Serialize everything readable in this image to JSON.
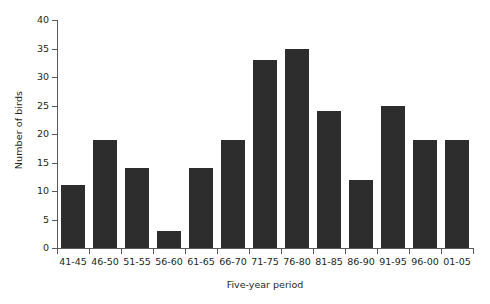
{
  "chart_data": {
    "type": "bar",
    "title": "",
    "subtitle": "",
    "xlabel": "Five-year period",
    "ylabel": "Number of birds",
    "categories": [
      "41-45",
      "46-50",
      "51-55",
      "56-60",
      "61-65",
      "66-70",
      "71-75",
      "76-80",
      "81-85",
      "86-90",
      "91-95",
      "96-00",
      "01-05"
    ],
    "values": [
      11,
      19,
      14,
      3,
      14,
      19,
      33,
      35,
      24,
      12,
      25,
      19,
      19
    ],
    "ylim": [
      0,
      40
    ],
    "ytick_labels": [
      "0",
      "5",
      "10",
      "15",
      "20",
      "25",
      "30",
      "35",
      "40"
    ],
    "ytick_values": [
      0,
      5,
      10,
      15,
      20,
      25,
      30,
      35,
      40
    ],
    "grid": false,
    "legend": null,
    "legend_position": "none",
    "bar_color": "#2d2d2d",
    "axis_color": "#58595b",
    "text_color": "#231f20",
    "background_color": "#ffffff"
  }
}
